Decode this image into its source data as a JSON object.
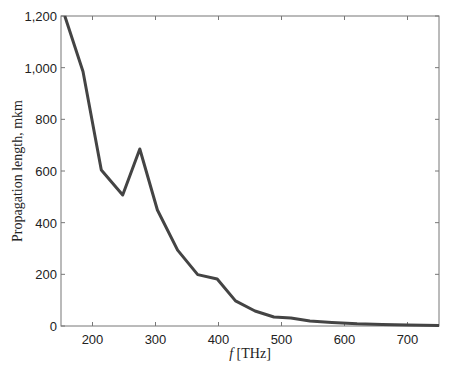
{
  "chart_data": {
    "type": "line",
    "title": "",
    "xlabel_italic": "f",
    "xlabel": "f [THz]",
    "xlabel_unit": "[THz]",
    "ylabel": "Propagation length, mkm",
    "xlim": [
      150,
      750
    ],
    "ylim": [
      0,
      1200
    ],
    "xticks": [
      200,
      300,
      400,
      500,
      600,
      700
    ],
    "xtick_labels": [
      "200",
      "300",
      "400",
      "500",
      "600",
      "700"
    ],
    "yticks": [
      0,
      200,
      400,
      600,
      800,
      1000,
      1200
    ],
    "ytick_labels": [
      "0",
      "200",
      "400",
      "600",
      "800",
      "1,000",
      "1,200"
    ],
    "grid": false,
    "legend": null,
    "series": [
      {
        "name": "Propagation length",
        "color": "#444444",
        "x": [
          156,
          185,
          214,
          248,
          275,
          303,
          335,
          367,
          398,
          427,
          458,
          488,
          515,
          545,
          580,
          620,
          660,
          700,
          750
        ],
        "y": [
          1200,
          985,
          604,
          507,
          685,
          449,
          294,
          199,
          182,
          97,
          58,
          35,
          31,
          19,
          14,
          9,
          6,
          4,
          2
        ]
      }
    ]
  }
}
